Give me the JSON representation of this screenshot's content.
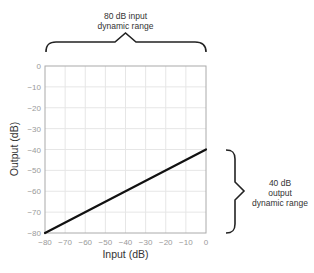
{
  "chart_data": {
    "type": "line",
    "title": "",
    "xlabel": "Input (dB)",
    "ylabel": "Output (dB)",
    "xlim": [
      -80,
      0
    ],
    "ylim": [
      -80,
      0
    ],
    "x_ticks": [
      "−80",
      "−70",
      "−60",
      "−50",
      "−40",
      "−30",
      "−20",
      "−10",
      "0"
    ],
    "y_ticks": [
      "0",
      "−10",
      "−20",
      "−30",
      "−40",
      "−50",
      "−60",
      "−70",
      "−80"
    ],
    "grid": true,
    "series": [
      {
        "name": "transfer",
        "x": [
          -80,
          0
        ],
        "y": [
          -80,
          -40
        ],
        "color": "#111111"
      }
    ],
    "annotations": {
      "input_range": [
        "80 dB input",
        "dynamic range"
      ],
      "output_range": [
        "40 dB",
        "output",
        "dynamic range"
      ]
    }
  }
}
